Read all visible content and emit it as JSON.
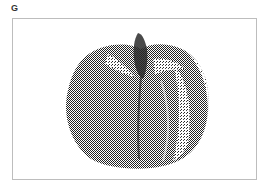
{
  "figure": {
    "panel_label": "G",
    "image_description": "Stippled halftone rendering of a pumpkin",
    "colors": {
      "ink": "#1a1a1a",
      "frame": "#bdbdbd",
      "background": "#ffffff"
    }
  }
}
